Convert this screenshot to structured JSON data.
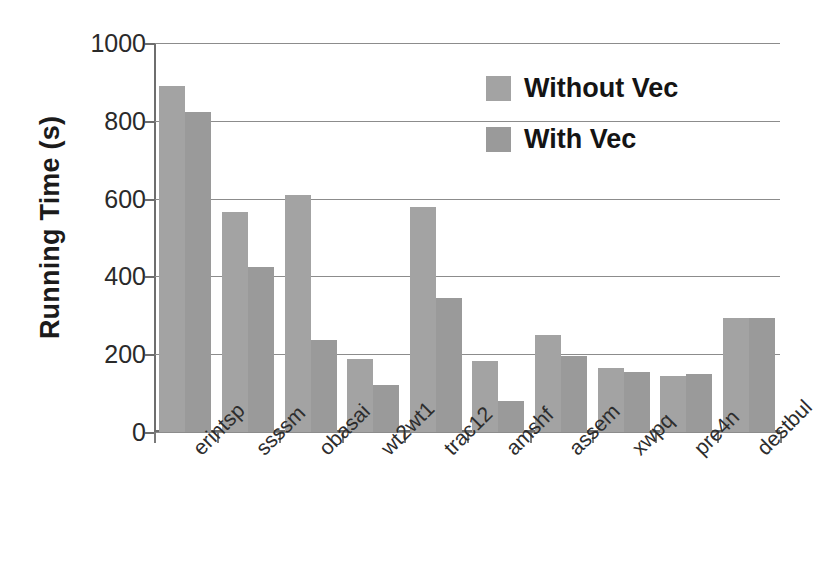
{
  "chart_data": {
    "type": "bar",
    "title": "",
    "xlabel": "",
    "ylabel": "Running Time (s)",
    "ylim": [
      0,
      1000
    ],
    "ytick_labels": [
      "1000",
      "800",
      "600",
      "400",
      "200",
      "0"
    ],
    "ytick_values": [
      1000,
      800,
      600,
      400,
      200,
      0
    ],
    "grid": true,
    "legend_position": "upper-right-inside",
    "categories": [
      "erintsp",
      "ssssm",
      "obasai",
      "wt2wt1",
      "trac12",
      "amshf",
      "assem",
      "xwpq",
      "pre4n",
      "destbul"
    ],
    "series": [
      {
        "name": "Without Vec",
        "color": "#a3a3a3",
        "values": [
          890,
          565,
          610,
          188,
          578,
          182,
          250,
          165,
          145,
          292
        ]
      },
      {
        "name": "With Vec",
        "color": "#9a9a9a",
        "values": [
          822,
          425,
          236,
          120,
          345,
          80,
          195,
          155,
          148,
          292
        ]
      }
    ]
  },
  "axis": {
    "y_title": "Running Time (s)"
  },
  "legend": {
    "items": [
      {
        "label": "Without Vec",
        "swatch_color": "#a3a3a3"
      },
      {
        "label": "With Vec",
        "swatch_color": "#9a9a9a"
      }
    ]
  },
  "colors": {
    "background": "#ffffff",
    "gridline": "#8c8c8c",
    "axis": "#6e6e6e",
    "text": "#1b1b1b",
    "series_without_vec": "#a3a3a3",
    "series_with_vec": "#9a9a9a"
  }
}
